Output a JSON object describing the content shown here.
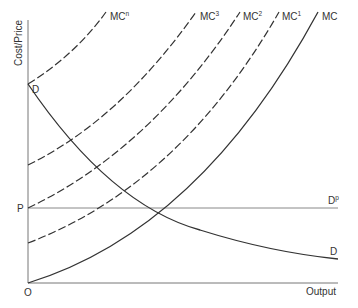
{
  "diagram": {
    "y_axis_label": "Cost/Price",
    "x_axis_label": "Output",
    "origin_label": "O",
    "price_label": "P",
    "demand_start_label": "D",
    "demand_end_label": "D",
    "perfect_demand_label": "D",
    "perfect_demand_sup": "p",
    "curves": [
      {
        "name": "MC",
        "base": "MC",
        "sup": "",
        "style": "solid"
      },
      {
        "name": "MC1",
        "base": "MC",
        "sup": "1",
        "style": "dashed"
      },
      {
        "name": "MC2",
        "base": "MC",
        "sup": "2",
        "style": "dashed"
      },
      {
        "name": "MC3",
        "base": "MC",
        "sup": "3",
        "style": "dashed"
      },
      {
        "name": "MCn",
        "base": "MC",
        "sup": "n",
        "style": "dashed"
      }
    ],
    "colors": {
      "line": "#333333",
      "axis": "#777777",
      "text": "#333333"
    }
  }
}
